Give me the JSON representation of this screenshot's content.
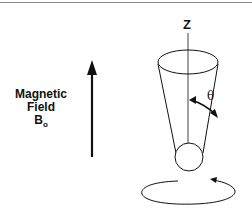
{
  "diagram": {
    "field_label": {
      "line1": "Magnetic",
      "line2": "Field",
      "symbol": "B",
      "subscript": "o"
    },
    "axis_label": "Z",
    "angle_label": "θ",
    "elements": [
      "magnetic-field-arrow",
      "precession-cone",
      "z-axis",
      "nucleus-sphere",
      "precession-circle-arrow",
      "angle-arc-arrow"
    ],
    "colors": {
      "line": "#111111",
      "rule": "#8a8a8a",
      "background": "#ffffff"
    }
  }
}
